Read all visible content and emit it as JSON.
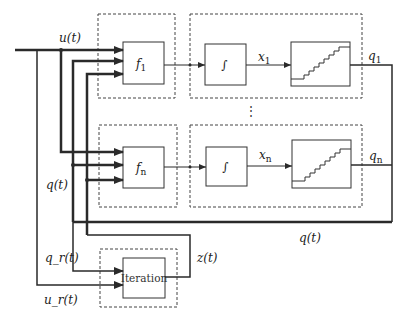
{
  "diagram": {
    "type": "block-diagram",
    "colors": {
      "line": "#2a2a2a",
      "dashed": "#444444",
      "background": "#ffffff"
    },
    "signals": {
      "input": "u(t)",
      "state_feedback": "q(t)",
      "state_feedback_bottom": "q(t)",
      "ref_state": "q_r(t)",
      "ref_input": "u_r(t)",
      "iteration_output": "z(t)"
    },
    "rows": [
      {
        "function_label": "f",
        "function_sub": "1",
        "integrator_symbol": "∫",
        "state_label": "x",
        "state_sub": "1",
        "quantizer_output_label": "q",
        "quantizer_output_sub": "1"
      },
      {
        "function_label": "f",
        "function_sub": "n",
        "integrator_symbol": "∫",
        "state_label": "x",
        "state_sub": "n",
        "quantizer_output_label": "q",
        "quantizer_output_sub": "n"
      }
    ],
    "ellipsis": "⋮",
    "iteration_block": {
      "label": "Iteration"
    }
  }
}
